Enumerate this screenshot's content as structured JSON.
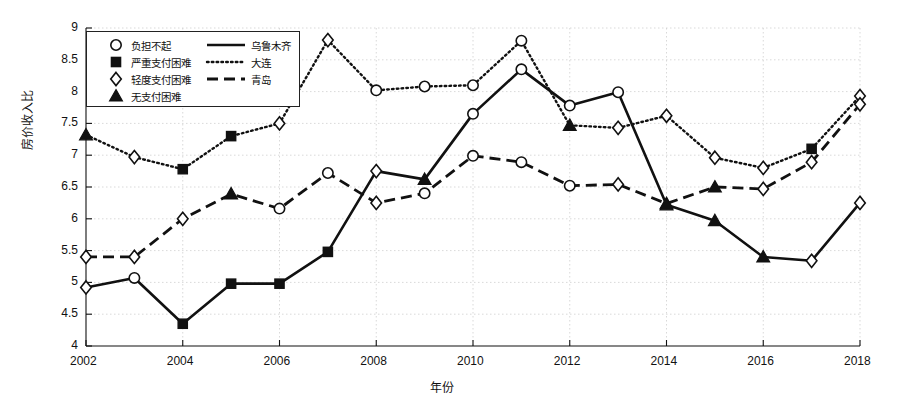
{
  "axes": {
    "ylabel": "房价收入比",
    "xlabel": "年份",
    "ylim": [
      4,
      9
    ],
    "yticks": [
      "4",
      "4.5",
      "5",
      "5.5",
      "6",
      "6.5",
      "7",
      "7.5",
      "8",
      "8.5",
      "9"
    ],
    "xticks": [
      "2002",
      "2004",
      "2006",
      "2008",
      "2010",
      "2012",
      "2014",
      "2016",
      "2018"
    ],
    "xlim": [
      2002,
      2018
    ],
    "grid": true
  },
  "legend": {
    "markers": [
      {
        "name": "circle-marker",
        "label": "负担不起"
      },
      {
        "name": "square-marker",
        "label": "严重支付困难"
      },
      {
        "name": "diamond-marker",
        "label": "轻度支付困难"
      },
      {
        "name": "triangle-marker",
        "label": "无支付困难"
      }
    ],
    "lines": [
      {
        "name": "solid-line",
        "label": "乌鲁木齐"
      },
      {
        "name": "dotted-line",
        "label": "大连"
      },
      {
        "name": "dashed-line",
        "label": "青岛"
      }
    ]
  },
  "chart_data": {
    "type": "line",
    "title": "",
    "xlabel": "年份",
    "ylabel": "房价收入比",
    "xlim": [
      2002,
      2018
    ],
    "ylim": [
      4,
      9
    ],
    "grid": true,
    "legend_position": "upper-left",
    "x": [
      2002,
      2003,
      2004,
      2005,
      2006,
      2007,
      2008,
      2009,
      2010,
      2011,
      2012,
      2013,
      2014,
      2015,
      2016,
      2017,
      2018
    ],
    "marker_categories": {
      "circle": "负担不起",
      "square": "严重支付困难",
      "diamond": "轻度支付困难",
      "triangle": "无支付困难"
    },
    "series": [
      {
        "name": "乌鲁木齐",
        "style": "solid",
        "values": [
          4.92,
          5.07,
          4.35,
          4.98,
          4.98,
          5.48,
          6.75,
          6.62,
          7.65,
          8.35,
          7.78,
          7.99,
          6.22,
          5.97,
          5.4,
          5.34,
          6.25
        ],
        "markers": [
          "diamond",
          "circle",
          "square",
          "square",
          "square",
          "square",
          "diamond",
          "triangle",
          "circle",
          "circle",
          "circle",
          "circle",
          "triangle",
          "triangle",
          "triangle",
          "diamond",
          "diamond"
        ]
      },
      {
        "name": "大连",
        "style": "dotted",
        "values": [
          7.32,
          6.97,
          6.78,
          7.3,
          7.5,
          8.81,
          8.02,
          8.08,
          8.1,
          8.8,
          7.47,
          7.43,
          7.62,
          6.96,
          6.8,
          7.1,
          7.93
        ],
        "markers": [
          "triangle",
          "diamond",
          "square",
          "square",
          "diamond",
          "diamond",
          "circle",
          "circle",
          "circle",
          "circle",
          "triangle",
          "diamond",
          "diamond",
          "diamond",
          "diamond",
          "square",
          "diamond"
        ]
      },
      {
        "name": "青岛",
        "style": "dashed",
        "values": [
          5.4,
          5.4,
          6.0,
          6.39,
          6.16,
          6.72,
          6.25,
          6.4,
          6.99,
          6.89,
          6.52,
          6.54,
          6.24,
          6.5,
          6.47,
          6.89,
          7.8
        ],
        "markers": [
          "diamond",
          "diamond",
          "diamond",
          "triangle",
          "circle",
          "circle",
          "diamond",
          "circle",
          "circle",
          "circle",
          "circle",
          "diamond",
          "triangle",
          "triangle",
          "diamond",
          "diamond",
          "diamond"
        ]
      }
    ]
  }
}
